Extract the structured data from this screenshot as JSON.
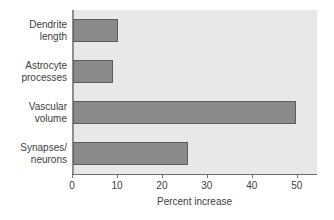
{
  "chart_data": {
    "type": "bar",
    "orientation": "horizontal",
    "title": "",
    "xlabel": "Percent increase",
    "ylabel": "",
    "categories": [
      "Dendrite\nlength",
      "Astrocyte\nprocesses",
      "Vascular\nvolume",
      "Synapses/\nneurons"
    ],
    "values": [
      10,
      9,
      49.5,
      25.5
    ],
    "xlim": [
      0,
      54.5
    ],
    "xticks": [
      0,
      10,
      20,
      30,
      40,
      50
    ],
    "xtick_labels": [
      "0",
      "10",
      "20",
      "30",
      "40",
      "50"
    ],
    "grid": false,
    "legend": null,
    "colors": {
      "bar_fill": "#8a8a8a",
      "bar_edge": "#5d5d5d",
      "plot_background": "#e8e8e6",
      "page_background": "#ffffff",
      "axis_line": "#6f6f6f",
      "text": "#3d3d3d"
    }
  }
}
